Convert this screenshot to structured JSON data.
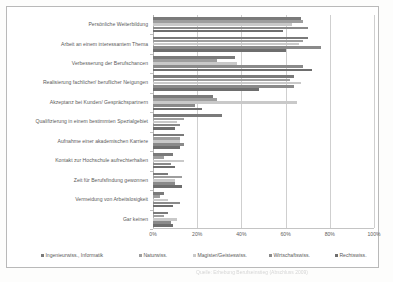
{
  "chart_data": {
    "type": "bar",
    "orientation": "horizontal",
    "title": "",
    "xlabel": "",
    "ylabel": "",
    "xlim": [
      0,
      100
    ],
    "xticks": [
      "0%",
      "20%",
      "40%",
      "60%",
      "80%",
      "100%"
    ],
    "xtick_values": [
      0,
      20,
      40,
      60,
      80,
      100
    ],
    "grid": true,
    "legend_position": "bottom",
    "categories": [
      "Persönliche Weiterbildung",
      "Arbeit an einem interessantem Thema",
      "Verbesserung der Berufschancen",
      "Realisierung fachlicher/ beruflicher Neigungen",
      "Akzeptanz bei Kunden/ Gesprächspartnern",
      "Qualifizierung in einem bestimmten Spezialgebiet",
      "Aufnahme einer akademischen Karriere",
      "Kontakt zur Hochschule aufrechterhalten",
      "Zeit für Berufsfindung gewonnen",
      "Vermeidung von Arbeitslosigkeit",
      "Gar keinen"
    ],
    "series": [
      {
        "name": "Ingenieurwiss., Informatik",
        "color": "#7a7a7a",
        "values": [
          67,
          70,
          37,
          64,
          27,
          31,
          14,
          9,
          7,
          5,
          7
        ]
      },
      {
        "name": "Naturwiss.",
        "color": "#9e9e9e",
        "values": [
          68,
          68,
          29,
          62,
          29,
          14,
          12,
          5,
          13,
          3,
          5
        ]
      },
      {
        "name": "Magister/Geisteswiss.",
        "color": "#c9c9c9",
        "values": [
          63,
          66,
          38,
          67,
          65,
          11,
          12,
          14,
          10,
          7,
          11
        ]
      },
      {
        "name": "Wirtschaftswiss.",
        "color": "#8a8a8a",
        "values": [
          70,
          76,
          68,
          64,
          19,
          12,
          14,
          8,
          10,
          12,
          8
        ]
      },
      {
        "name": "Rechtswiss.",
        "color": "#6e6e6e",
        "values": [
          59,
          60,
          72,
          48,
          22,
          10,
          12,
          10,
          13,
          9,
          9
        ]
      }
    ]
  },
  "legend": {
    "items": [
      {
        "label": "Ingenieurwiss., Informatik",
        "color": "#7a7a7a",
        "left": 26
      },
      {
        "label": "Naturwiss.",
        "color": "#9e9e9e",
        "left": 124
      },
      {
        "label": "Magister/Geisteswiss.",
        "color": "#c9c9c9",
        "left": 178
      },
      {
        "label": "Wirtschaftswiss.",
        "color": "#8a8a8a",
        "left": 254
      },
      {
        "label": "Rechtswiss.",
        "color": "#6e6e6e",
        "left": 320
      }
    ]
  },
  "caption": {
    "text": "Quelle:  Erhebung  Berufseinstieg  (Abschluss 2009)"
  }
}
